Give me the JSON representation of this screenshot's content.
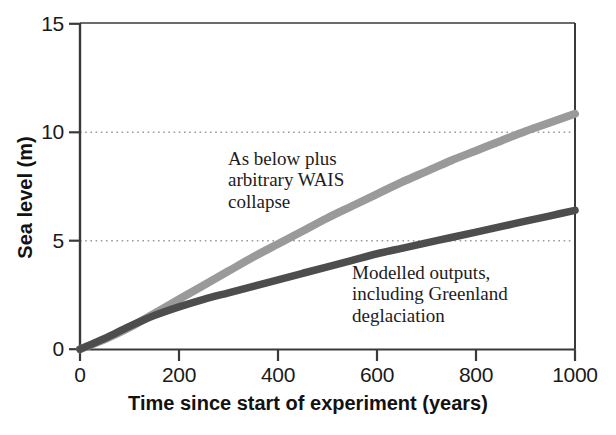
{
  "chart_data": {
    "type": "line",
    "title": "",
    "xlabel": "Time since start of experiment (years)",
    "ylabel": "Sea level (m)",
    "xlim": [
      0,
      1000
    ],
    "ylim": [
      0,
      15
    ],
    "xticks": [
      "0",
      "200",
      "400",
      "600",
      "800",
      "1000"
    ],
    "xtick_values": [
      0,
      200,
      400,
      600,
      800,
      1000
    ],
    "yticks": [
      "0",
      "5",
      "10",
      "15"
    ],
    "ytick_values": [
      0,
      5,
      10,
      15
    ],
    "grid": "horizontal dotted gridlines at y = 5 and y = 10",
    "gridlines": [
      5,
      10
    ],
    "legend": "inline annotations",
    "series": [
      {
        "name": "As below plus arbitrary WAIS collapse",
        "color": "#9a9a9a",
        "x": [
          0,
          50,
          100,
          150,
          200,
          250,
          300,
          350,
          400,
          450,
          500,
          550,
          600,
          650,
          700,
          750,
          800,
          850,
          900,
          950,
          1000
        ],
        "values": [
          0.0,
          0.45,
          1.0,
          1.65,
          2.3,
          2.95,
          3.6,
          4.25,
          4.85,
          5.45,
          6.05,
          6.6,
          7.15,
          7.7,
          8.2,
          8.7,
          9.15,
          9.6,
          10.05,
          10.45,
          10.85
        ]
      },
      {
        "name": "Modelled outputs, including Greenland deglaciation",
        "color": "#4d4d4d",
        "x": [
          0,
          50,
          100,
          150,
          200,
          250,
          300,
          350,
          400,
          450,
          500,
          550,
          600,
          650,
          700,
          750,
          800,
          850,
          900,
          950,
          1000
        ],
        "values": [
          0.0,
          0.5,
          1.05,
          1.55,
          1.95,
          2.3,
          2.6,
          2.9,
          3.2,
          3.5,
          3.8,
          4.1,
          4.4,
          4.65,
          4.9,
          5.15,
          5.4,
          5.65,
          5.9,
          6.15,
          6.4
        ]
      }
    ],
    "annotations": [
      {
        "name": "upper-annotation",
        "text": "As below plus\narbitrary WAIS\ncollapse"
      },
      {
        "name": "lower-annotation",
        "text": "Modelled outputs,\nincluding Greenland\ndeglaciation"
      }
    ]
  },
  "axis": {
    "x_label": "Time since start of experiment (years)",
    "y_label": "Sea level (m)",
    "x_tick_labels": [
      "0",
      "200",
      "400",
      "600",
      "800",
      "1000"
    ],
    "y_tick_labels": [
      "0",
      "5",
      "10",
      "15"
    ]
  },
  "colors": {
    "wais_series": "#9a9a9a",
    "modelled_series": "#4d4d4d",
    "axis": "#3a3a3a",
    "grid": "#9b9b9b",
    "text": "#1a1a1a",
    "background": "#ffffff"
  }
}
